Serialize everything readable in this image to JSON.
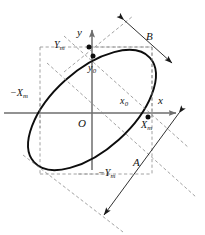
{
  "figure": {
    "type": "geometry-diagram",
    "background_color": "#ffffff",
    "curve_color": "#0d0d0d",
    "axis_color": "#6e6e6e",
    "dashed_color": "#8a8a8a",
    "label_color": "#111111"
  },
  "axes": {
    "x_label": "x",
    "y_label": "y",
    "origin_label": "O",
    "x_axis": {
      "x1": 4,
      "y1": 113,
      "x2": 178,
      "y2": 113
    },
    "y_axis": {
      "x1": 92,
      "y1": 168,
      "x2": 92,
      "y2": 28
    }
  },
  "labels": {
    "y_max": "Y",
    "y_max_sub": "m",
    "y_min": "−Y",
    "y_min_sub": "m",
    "x_max": "X",
    "x_max_sub": "m",
    "x_min": "−X",
    "x_min_sub": "m",
    "x_intercept": "x",
    "x_intercept_sub": "0",
    "y_intercept": "y",
    "y_intercept_sub": "0",
    "major_axis": "A",
    "minor_axis": "B"
  },
  "ellipse": {
    "center_x": 92,
    "center_y": 110,
    "semi_major": 78,
    "semi_minor": 40,
    "rotation_deg": -42
  },
  "points": [
    {
      "name": "y-axis-top-intercept",
      "label_ref": "y_intercept",
      "x": 93,
      "y": 56
    },
    {
      "name": "ellipse-top-tangent",
      "label_ref": "y_max",
      "x": 89,
      "y": 47
    },
    {
      "name": "ellipse-right-tangent",
      "label_ref": "x_max",
      "x": 146,
      "y": 116
    }
  ],
  "dimension_lines": [
    {
      "name": "major-axis-dimension",
      "label": "A",
      "label_x": 134,
      "label_y": 163
    },
    {
      "name": "minor-axis-dimension",
      "label": "B",
      "label_x": 146,
      "label_y": 37
    }
  ]
}
